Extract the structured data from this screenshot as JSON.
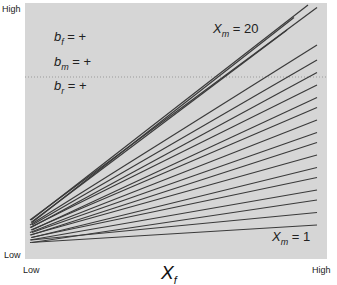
{
  "chart_data": {
    "type": "line",
    "title": "",
    "xlabel": "X_f",
    "ylabel": "",
    "x_ticks": [
      "Low",
      "High"
    ],
    "y_ticks": [
      "Low",
      "High"
    ],
    "legend": [
      {
        "symbol": "b_f",
        "value": "+"
      },
      {
        "symbol": "b_m",
        "value": "+"
      },
      {
        "symbol": "b_r",
        "value": "+"
      }
    ],
    "annotations": [
      {
        "text": "X_m = 20",
        "position": "top"
      },
      {
        "text": "X_m = 1",
        "position": "bottom-right"
      }
    ],
    "series_description": "Family of 20 straight lines, one per X_m value from 1 to 20, fanning out from the low-X_f end; slope increases with X_m",
    "x": [
      0,
      1
    ],
    "series": [
      {
        "name": "X_m = 1",
        "values": [
          0.05,
          0.12
        ]
      },
      {
        "name": "X_m = 2",
        "values": [
          0.06,
          0.17
        ]
      },
      {
        "name": "X_m = 3",
        "values": [
          0.05,
          0.22
        ]
      },
      {
        "name": "X_m = 4",
        "values": [
          0.06,
          0.26
        ]
      },
      {
        "name": "X_m = 5",
        "values": [
          0.07,
          0.31
        ]
      },
      {
        "name": "X_m = 6",
        "values": [
          0.07,
          0.35
        ]
      },
      {
        "name": "X_m = 7",
        "values": [
          0.08,
          0.4
        ]
      },
      {
        "name": "X_m = 8",
        "values": [
          0.08,
          0.45
        ]
      },
      {
        "name": "X_m = 9",
        "values": [
          0.09,
          0.49
        ]
      },
      {
        "name": "X_m = 10",
        "values": [
          0.09,
          0.54
        ]
      },
      {
        "name": "X_m = 11",
        "values": [
          0.1,
          0.59
        ]
      },
      {
        "name": "X_m = 12",
        "values": [
          0.1,
          0.63
        ]
      },
      {
        "name": "X_m = 13",
        "values": [
          0.11,
          0.68
        ]
      },
      {
        "name": "X_m = 14",
        "values": [
          0.11,
          0.73
        ]
      },
      {
        "name": "X_m = 15",
        "values": [
          0.12,
          0.78
        ]
      },
      {
        "name": "X_m = 16",
        "values": [
          0.12,
          0.84
        ]
      },
      {
        "name": "X_m = 17",
        "values": [
          0.13,
          0.9
        ]
      },
      {
        "name": "X_m = 18",
        "values": [
          0.13,
          0.95
        ]
      },
      {
        "name": "X_m = 19",
        "values": [
          0.14,
          0.99
        ]
      },
      {
        "name": "X_m = 20",
        "values": [
          0.14,
          1.0
        ]
      }
    ],
    "xlim": [
      0,
      1
    ],
    "ylim": [
      0,
      1
    ],
    "grid": false,
    "legend_position": "upper-left"
  },
  "axes": {
    "y_high": "High",
    "y_low": "Low",
    "x_low": "Low",
    "x_high": "High",
    "x_title_main": "X",
    "x_title_sub": "f"
  },
  "legend": {
    "rows": [
      {
        "main": "b",
        "sub": "f",
        "rest": " = +"
      },
      {
        "main": "b",
        "sub": "m",
        "rest": " = +"
      },
      {
        "main": "b",
        "sub": "r",
        "rest": " = +"
      }
    ]
  },
  "annotations": {
    "top": {
      "main": "X",
      "sub": "m",
      "rest": " = 20"
    },
    "bottom": {
      "main": "X",
      "sub": "m",
      "rest": " = 1"
    }
  },
  "colors": {
    "plot_background": "#d6d6d6",
    "line": "#3a3a3a",
    "text": "#222222"
  }
}
